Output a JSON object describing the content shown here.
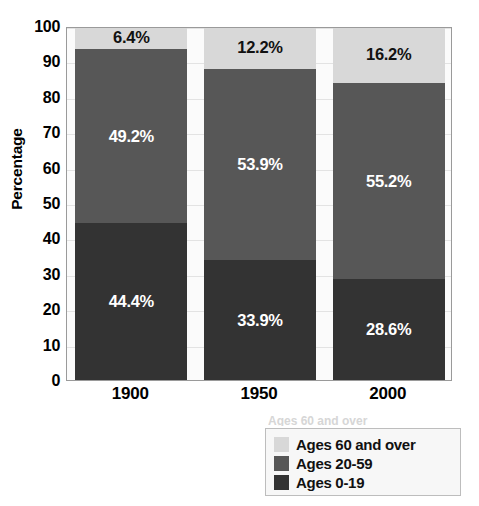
{
  "chart_data": {
    "type": "bar",
    "subtype": "stacked-bar-100",
    "title": "",
    "xlabel": "",
    "ylabel": "Percentage",
    "categories": [
      "1900",
      "1950",
      "2000"
    ],
    "ylim": [
      0,
      100
    ],
    "yticks": [
      "0",
      "10",
      "20",
      "30",
      "40",
      "50",
      "60",
      "70",
      "80",
      "90",
      "100"
    ],
    "ytick_values": [
      0,
      10,
      20,
      30,
      40,
      50,
      60,
      70,
      80,
      90,
      100
    ],
    "grid": true,
    "legend_position": "bottom-right",
    "series": [
      {
        "name": "Ages 0-19",
        "color": "#333333",
        "label_color": "#ffffff",
        "values": [
          44.4,
          33.9,
          28.6
        ],
        "labels": [
          "44.4%",
          "33.9%",
          "28.6%"
        ]
      },
      {
        "name": "Ages 20-59",
        "color": "#575757",
        "label_color": "#ffffff",
        "values": [
          49.2,
          53.9,
          55.2
        ],
        "labels": [
          "49.2%",
          "53.9%",
          "55.2%"
        ]
      },
      {
        "name": "Ages 60 and over",
        "color": "#d8d8d8",
        "label_color": "#111111",
        "values": [
          6.4,
          12.2,
          16.2
        ],
        "labels": [
          "6.4%",
          "12.2%",
          "16.2%"
        ]
      }
    ],
    "legend_entries": [
      {
        "label": "Ages 60 and over",
        "color": "#d8d8d8"
      },
      {
        "label": "Ages 20-59",
        "color": "#575757"
      },
      {
        "label": "Ages 0-19",
        "color": "#333333"
      }
    ]
  },
  "legend_ghost_text": "Ages 60 and over"
}
